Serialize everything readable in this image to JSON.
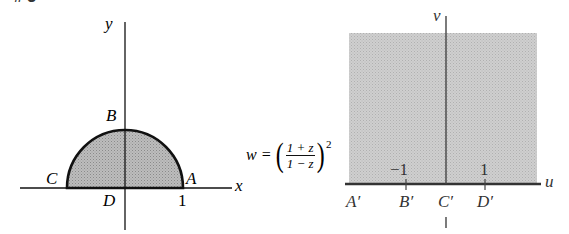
{
  "figure": {
    "label_fragment": "# 3"
  },
  "z_plane": {
    "axis_x_label": "x",
    "axis_y_label": "y",
    "points": {
      "A": "A",
      "B": "B",
      "C": "C",
      "D": "D"
    },
    "tick_1": "1",
    "region": "upper half-disk |z|<1, Im z>0",
    "fill_color": "#aaaaaa"
  },
  "mapping": {
    "lhs": "w =",
    "numerator": "1 + z",
    "denominator": "1 − z",
    "exponent": "2"
  },
  "w_plane": {
    "axis_u_label": "u",
    "axis_v_label": "v",
    "points": {
      "A_prime": "A′",
      "B_prime": "B′",
      "C_prime": "C′",
      "D_prime": "D′"
    },
    "tick_neg1": "−1",
    "tick_1": "1",
    "region": "upper half-plane",
    "fill_color": "#c4c4c4"
  }
}
